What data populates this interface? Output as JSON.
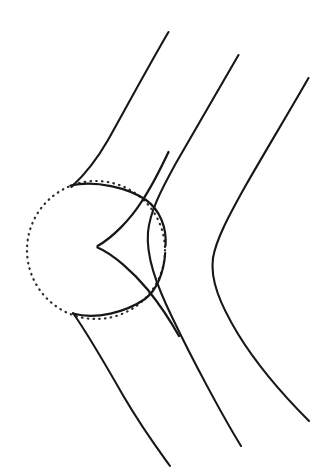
{
  "figure": {
    "background_color": "#ffffff",
    "stroke_color": "#17171a",
    "dotted_stroke_color": "#2b2b30",
    "width": 320,
    "height": 474,
    "watermark": "",
    "circle": {
      "label": "refracting-circle",
      "center_x": 96,
      "center_y": 250,
      "radius": 69,
      "style": "dotted",
      "dash_pattern": "0.6 5.2"
    },
    "arcs": [
      {
        "label": "upper-solid-arc",
        "d": "M 70.5 185.5 C 96 180 128 188 146 200 C 160 210 167 228 165.5 246"
      },
      {
        "label": "lower-solid-arc",
        "d": "M 73 313.5 C 96 320 126 312 145 299 C 157 290 164 272 165.2 253"
      }
    ],
    "caustic": {
      "label": "caustic-cusp-curve",
      "cusp_x": 97,
      "cusp_y": 246,
      "upper_branch_d": "M 97.5 246 C 112 238 130 220 142 201 C 152 186 160 170 168.5 152",
      "lower_branch_d": "M 97.5 247.5 C 113 254 133 272 148 290 C 160 305 170 320 179 336"
    },
    "rays": [
      {
        "label": "ray-1-left",
        "incoming_top_x": 168,
        "incoming_top_y": 32,
        "tangent_x": 71,
        "tangent_y": 187,
        "outgoing_end_x": 170,
        "outgoing_end_y": 466,
        "incoming_d": "M 168.5 32 C 152 60 128 104 108 140 C 92 168 79 180 71.5 187",
        "outgoing_d": "M 73 313 C 85 330 104 362 124 397 C 144 431 160 452 170 466"
      },
      {
        "label": "ray-2-middle",
        "incoming_top_x": 238,
        "incoming_top_y": 55,
        "outgoing_end_x": 241,
        "outgoing_end_y": 446,
        "d": "M 238.5 55 C 222 84 196 128 176 163 C 160 192 150 212 148 232 C 146 256 156 284 172 317 C 192 359 222 415 241 446"
      },
      {
        "label": "ray-3-right",
        "incoming_top_x": 308,
        "incoming_top_y": 78,
        "outgoing_end_x": 309,
        "outgoing_end_y": 421,
        "d": "M 308.5 78 C 292 107 266 150 246 185 C 228 217 216 240 213 258 C 210 280 220 304 238 334 C 262 373 294 406 309 421"
      }
    ]
  },
  "chart_data": {
    "type": "line",
    "xlabel": "",
    "ylabel": "",
    "xlim": [
      0,
      320
    ],
    "ylim": [
      474,
      0
    ],
    "grid": false,
    "legend": "none",
    "series": [
      {
        "name": "refracting-circle",
        "kind": "dotted-circle",
        "center": [
          96,
          250
        ],
        "radius": 69
      },
      {
        "name": "ray-1-left",
        "kind": "polyline",
        "x": [
          168,
          108,
          71,
          73,
          124,
          170
        ],
        "y": [
          32,
          140,
          187,
          313,
          397,
          466
        ]
      },
      {
        "name": "ray-2-middle",
        "kind": "polyline",
        "x": [
          238,
          176,
          148,
          172,
          241
        ],
        "y": [
          55,
          163,
          232,
          317,
          446
        ]
      },
      {
        "name": "ray-3-right",
        "kind": "polyline",
        "x": [
          308,
          246,
          213,
          238,
          309
        ],
        "y": [
          78,
          185,
          258,
          334,
          421
        ]
      },
      {
        "name": "caustic-upper-branch",
        "kind": "polyline",
        "x": [
          97,
          142,
          168
        ],
        "y": [
          246,
          201,
          152
        ]
      },
      {
        "name": "caustic-lower-branch",
        "kind": "polyline",
        "x": [
          97,
          148,
          179
        ],
        "y": [
          247,
          290,
          336
        ]
      },
      {
        "name": "upper-solid-arc",
        "kind": "arc",
        "x": [
          70,
          146,
          165
        ],
        "y": [
          185,
          200,
          246
        ]
      },
      {
        "name": "lower-solid-arc",
        "kind": "arc",
        "x": [
          73,
          145,
          165
        ],
        "y": [
          313,
          299,
          253
        ]
      }
    ],
    "annotations": [
      {
        "text": "cusp",
        "x": 97,
        "y": 246,
        "visible": false
      }
    ]
  }
}
